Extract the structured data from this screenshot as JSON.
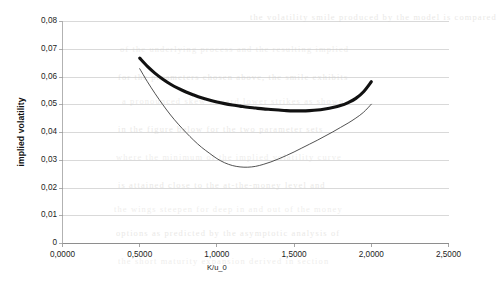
{
  "chart_data": {
    "type": "line",
    "title": "",
    "xlabel": "K/u_0",
    "ylabel": "implied volatility",
    "xlim": [
      0.0,
      2.5
    ],
    "ylim": [
      0.0,
      0.08
    ],
    "grid": true,
    "legend": "none",
    "x_tick_labels": [
      "0,0000",
      "0,5000",
      "1,0000",
      "1,5000",
      "2,0000",
      "2,5000"
    ],
    "x_tick_values": [
      0.0,
      0.5,
      1.0,
      1.5,
      2.0,
      2.5
    ],
    "y_tick_labels": [
      "0",
      "0,01",
      "0,02",
      "0,03",
      "0,04",
      "0,05",
      "0,06",
      "0,07",
      "0,08"
    ],
    "y_tick_values": [
      0,
      0.01,
      0.02,
      0.03,
      0.04,
      0.05,
      0.06,
      0.07,
      0.08
    ],
    "series": [
      {
        "name": "thick-smile",
        "style": "thick-solid",
        "color": "#111111",
        "width": 3.1,
        "x": [
          0.5,
          0.55,
          0.6,
          0.65,
          0.7,
          0.75,
          0.8,
          0.85,
          0.9,
          0.95,
          1.0,
          1.05,
          1.1,
          1.15,
          1.2,
          1.25,
          1.3,
          1.35,
          1.4,
          1.45,
          1.5,
          1.55,
          1.6,
          1.65,
          1.7,
          1.75,
          1.8,
          1.85,
          1.9,
          1.95,
          2.0
        ],
        "y": [
          0.0668,
          0.0638,
          0.0613,
          0.0592,
          0.0574,
          0.0559,
          0.0546,
          0.0535,
          0.0525,
          0.0517,
          0.051,
          0.0504,
          0.0499,
          0.0495,
          0.0491,
          0.0488,
          0.0485,
          0.0483,
          0.0481,
          0.0479,
          0.0478,
          0.0478,
          0.0479,
          0.0481,
          0.0485,
          0.049,
          0.0497,
          0.0508,
          0.0523,
          0.0547,
          0.0583
        ]
      },
      {
        "name": "thin-smile",
        "style": "thin-solid",
        "color": "#333333",
        "width": 0.85,
        "x": [
          0.5,
          0.55,
          0.6,
          0.65,
          0.7,
          0.75,
          0.8,
          0.85,
          0.9,
          0.95,
          1.0,
          1.05,
          1.1,
          1.15,
          1.2,
          1.25,
          1.3,
          1.35,
          1.4,
          1.45,
          1.5,
          1.55,
          1.6,
          1.65,
          1.7,
          1.75,
          1.8,
          1.85,
          1.9,
          1.95,
          2.0
        ],
        "y": [
          0.063,
          0.0583,
          0.054,
          0.05,
          0.0463,
          0.043,
          0.04,
          0.0372,
          0.0347,
          0.0326,
          0.0306,
          0.0291,
          0.0281,
          0.0276,
          0.0275,
          0.0278,
          0.0285,
          0.0294,
          0.0305,
          0.0317,
          0.033,
          0.0344,
          0.0358,
          0.0372,
          0.0387,
          0.0402,
          0.0418,
          0.0434,
          0.0452,
          0.0473,
          0.0502
        ]
      }
    ]
  },
  "background_text": {
    "lines": [
      "the volatility smile produced by the model is compared",
      "of the underlying process and the resulting implied",
      "for the parameters chosen above, the smile exhibits",
      "a pronounced skew toward lower strikes as shown",
      "in the figure below for the two parameter sets",
      "where the minimum of the implied volatility curve",
      "is attained close to the at-the-money level and",
      "the wings steepen for deep in and out of the money",
      "options as predicted by the asymptotic analysis of",
      "the short maturity expansion derived in section"
    ]
  }
}
